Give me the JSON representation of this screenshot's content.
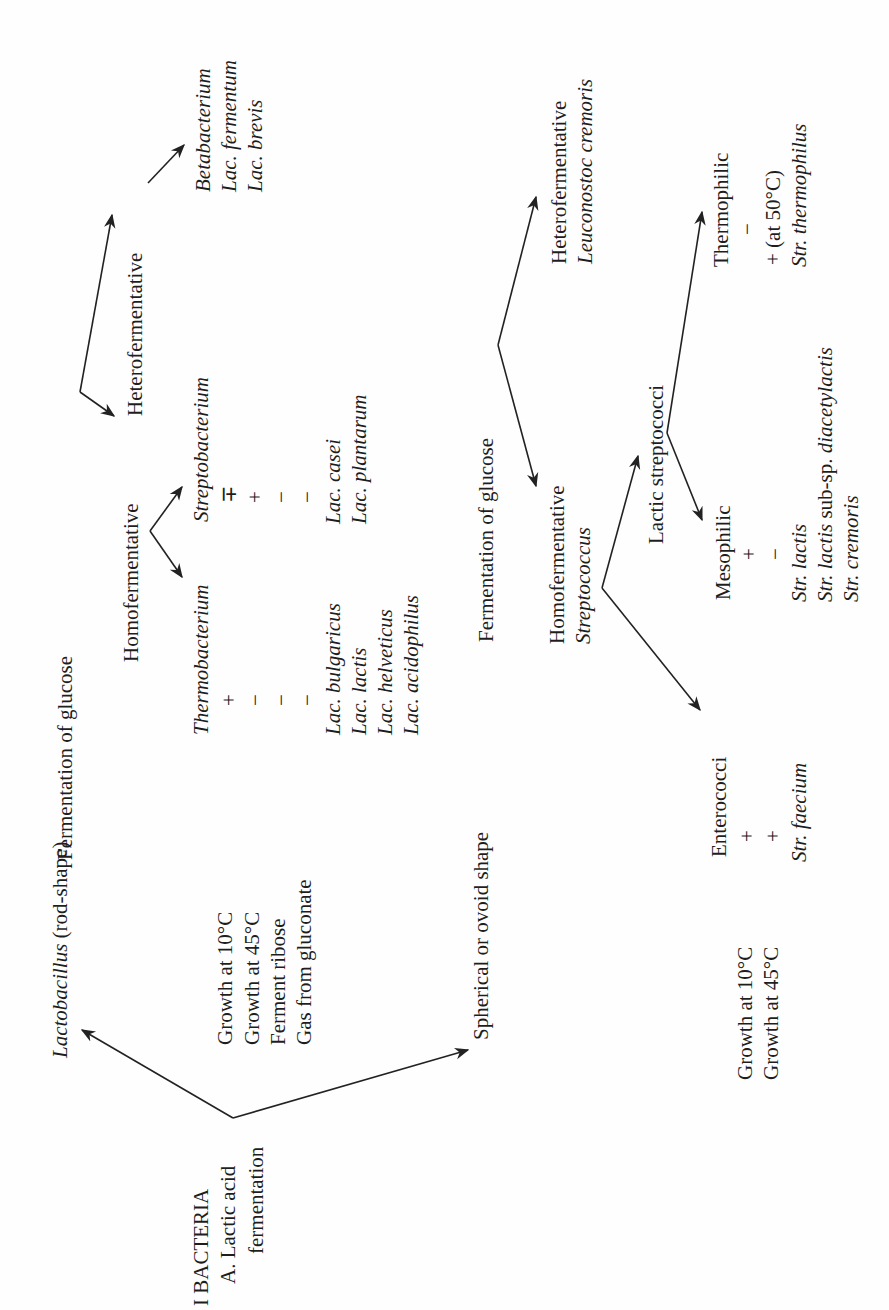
{
  "heading": {
    "section": "I BACTERIA",
    "subsection": "A. Lactic acid",
    "subsection_cont": "fermentation"
  },
  "branches": {
    "rod": {
      "label_genus": "Lactobacillus",
      "label_rest": " (rod-shape)",
      "tests": [
        "Growth at 10°C",
        "Growth at 45°C",
        "Ferment ribose",
        "Gas from gluconate"
      ],
      "criterion": "Fermentation of glucose",
      "homo": {
        "label": "Homofermentative",
        "groups": [
          {
            "name": "Thermobacterium",
            "signs": [
              "+",
              "−",
              "−",
              "−"
            ],
            "species": [
              "Lac. bulgaricus",
              "Lac. lactis",
              "Lac. helveticus",
              "Lac. acidophilus"
            ]
          },
          {
            "name": "Streptobacterium",
            "signs": [
              "∓",
              "+",
              "−",
              "−"
            ],
            "species": [
              "Lac. casei",
              "Lac. plantarum"
            ]
          }
        ]
      },
      "hetero": {
        "label": "Heterofermentative",
        "group": "Betabacterium",
        "species": [
          "Lac. fermentum",
          "Lac. brevis"
        ]
      }
    },
    "sphere": {
      "label": "Spherical or ovoid shape",
      "tests": [
        "Growth at 10°C",
        "Growth at 45°C"
      ],
      "criterion": "Fermentation of glucose",
      "homo": {
        "label": "Homofermentative",
        "genus": "Streptococcus",
        "enterococci": {
          "label": "Enterococci",
          "signs": [
            "+",
            "+"
          ],
          "species": [
            "Str. faecium"
          ]
        },
        "lactic": {
          "label": "Lactic streptococci",
          "mesophilic": {
            "label": "Mesophilic",
            "signs": [
              "+",
              "−"
            ],
            "species": [
              "Str. lactis",
              "Str. lactis sub-sp. diacetylactis",
              "Str. cremoris"
            ]
          },
          "thermophilic": {
            "label": "Thermophilic",
            "signs": [
              "−",
              "+ (at 50°C)"
            ],
            "species": [
              "Str. thermophilus"
            ]
          }
        }
      },
      "hetero": {
        "label": "Heterofermentative",
        "species": "Leuconostoc cremoris"
      }
    }
  }
}
